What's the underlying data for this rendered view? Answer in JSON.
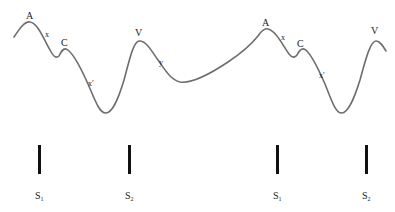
{
  "diagram": {
    "type": "waveform-with-stimulus-markers",
    "colors": {
      "curve": "#6e6e6e",
      "bars": "#111111",
      "text": "#222222",
      "background": "#ffffff"
    },
    "cycles": [
      {
        "peak_labels": {
          "A": "A",
          "C": "C",
          "V": "V"
        },
        "segment_labels": {
          "x": "x",
          "x_prime": "x′",
          "y": "y"
        }
      },
      {
        "peak_labels": {
          "A": "A",
          "C": "C",
          "V": "V"
        },
        "segment_labels": {
          "x": "x",
          "x_prime": "x′"
        }
      }
    ],
    "markers": [
      {
        "label": "S",
        "subscript": "1"
      },
      {
        "label": "S",
        "subscript": "2"
      },
      {
        "label": "S",
        "subscript": "1"
      },
      {
        "label": "S",
        "subscript": "2"
      }
    ]
  }
}
